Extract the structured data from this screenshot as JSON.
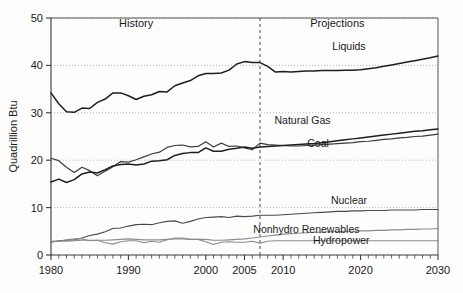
{
  "chart_data": {
    "type": "line",
    "title": "",
    "xlabel": "",
    "ylabel": "Quadrillion Btu",
    "xlim": [
      1980,
      2030
    ],
    "ylim": [
      0,
      50
    ],
    "yticks": [
      0,
      10,
      20,
      30,
      40,
      50
    ],
    "ytick_labels": [
      "0",
      "10",
      "20",
      "30",
      "40",
      "50"
    ],
    "xticks": [
      1980,
      1990,
      2000,
      2005,
      2010,
      2020,
      2030
    ],
    "xtick_labels": [
      "1980",
      "1990",
      "2000",
      "2005",
      "2010",
      "2020",
      "2030"
    ],
    "grid": "horizontal-dotted",
    "legend_position": "inline-right-labels",
    "annotations": [
      {
        "text": "History",
        "x": 1991,
        "y": 48.2,
        "name": "history-annotation"
      },
      {
        "text": "Projections",
        "x": 2017,
        "y": 48.2,
        "name": "projections-annotation"
      }
    ],
    "divider": {
      "x": 2007,
      "style": "dashed",
      "label": "history-projection-divider"
    },
    "series": [
      {
        "name": "Liquids",
        "color": "#1f1f1f",
        "width": 1.5,
        "label_x": 2018.5,
        "label_y": 43.3,
        "x": [
          1980,
          1981,
          1982,
          1983,
          1984,
          1985,
          1986,
          1987,
          1988,
          1989,
          1990,
          1991,
          1992,
          1993,
          1994,
          1995,
          1996,
          1997,
          1998,
          1999,
          2000,
          2001,
          2002,
          2003,
          2004,
          2005,
          2006,
          2007,
          2008,
          2009,
          2010,
          2011,
          2012,
          2013,
          2014,
          2015,
          2016,
          2017,
          2018,
          2019,
          2020,
          2021,
          2022,
          2023,
          2024,
          2025,
          2026,
          2027,
          2028,
          2029,
          2030
        ],
        "y": [
          34.2,
          31.9,
          30.2,
          30.1,
          31.0,
          30.9,
          32.2,
          32.9,
          34.2,
          34.2,
          33.6,
          32.8,
          33.5,
          33.8,
          34.5,
          34.4,
          35.7,
          36.3,
          36.8,
          37.8,
          38.3,
          38.3,
          38.4,
          39.0,
          40.3,
          40.8,
          40.6,
          40.6,
          39.8,
          38.6,
          38.7,
          38.6,
          38.7,
          38.8,
          38.8,
          38.9,
          38.9,
          38.9,
          39.0,
          39.0,
          39.1,
          39.3,
          39.5,
          39.8,
          40.1,
          40.4,
          40.7,
          41.0,
          41.3,
          41.6,
          42.0
        ]
      },
      {
        "name": "Natural Gas",
        "color": "#3c3c3c",
        "width": 1.2,
        "label_x": 2012.5,
        "label_y": 27.6,
        "x": [
          1980,
          1981,
          1982,
          1983,
          1984,
          1985,
          1986,
          1987,
          1988,
          1989,
          1990,
          1991,
          1992,
          1993,
          1994,
          1995,
          1996,
          1997,
          1998,
          1999,
          2000,
          2001,
          2002,
          2003,
          2004,
          2005,
          2006,
          2007,
          2008,
          2009,
          2010,
          2011,
          2012,
          2013,
          2014,
          2015,
          2016,
          2017,
          2018,
          2019,
          2020,
          2021,
          2022,
          2023,
          2024,
          2025,
          2026,
          2027,
          2028,
          2029,
          2030
        ],
        "y": [
          20.4,
          19.9,
          18.5,
          17.4,
          18.5,
          17.8,
          16.7,
          17.7,
          18.6,
          19.7,
          19.6,
          20.1,
          20.7,
          21.3,
          21.7,
          22.7,
          23.1,
          23.2,
          22.8,
          22.9,
          23.9,
          22.8,
          23.6,
          22.9,
          23.0,
          22.6,
          22.2,
          23.6,
          23.3,
          23.2,
          23.1,
          23.0,
          23.0,
          23.1,
          23.2,
          23.3,
          23.4,
          23.5,
          23.6,
          23.7,
          23.9,
          24.0,
          24.2,
          24.4,
          24.5,
          24.7,
          24.8,
          25.0,
          25.1,
          25.3,
          25.5
        ]
      },
      {
        "name": "Coal",
        "color": "#1f1f1f",
        "width": 1.5,
        "label_x": 2014.5,
        "label_y": 22.8,
        "x": [
          1980,
          1981,
          1982,
          1983,
          1984,
          1985,
          1986,
          1987,
          1988,
          1989,
          1990,
          1991,
          1992,
          1993,
          1994,
          1995,
          1996,
          1997,
          1998,
          1999,
          2000,
          2001,
          2002,
          2003,
          2004,
          2005,
          2006,
          2007,
          2008,
          2009,
          2010,
          2011,
          2012,
          2013,
          2014,
          2015,
          2016,
          2017,
          2018,
          2019,
          2020,
          2021,
          2022,
          2023,
          2024,
          2025,
          2026,
          2027,
          2028,
          2029,
          2030
        ],
        "y": [
          15.4,
          16.0,
          15.3,
          15.9,
          17.1,
          17.5,
          17.3,
          18.0,
          18.8,
          19.1,
          19.2,
          19.0,
          19.2,
          19.8,
          19.9,
          20.1,
          21.0,
          21.4,
          21.6,
          21.6,
          22.6,
          21.9,
          21.9,
          22.3,
          22.5,
          22.8,
          22.5,
          22.8,
          22.9,
          23.0,
          23.1,
          23.2,
          23.3,
          23.4,
          23.5,
          23.7,
          23.9,
          24.1,
          24.3,
          24.5,
          24.7,
          24.9,
          25.1,
          25.3,
          25.5,
          25.7,
          25.9,
          26.1,
          26.2,
          26.4,
          26.6
        ]
      },
      {
        "name": "Nuclear",
        "color": "#4a4a4a",
        "width": 1.1,
        "label_x": 2018.5,
        "label_y": 10.7,
        "x": [
          1980,
          1981,
          1982,
          1983,
          1984,
          1985,
          1986,
          1987,
          1988,
          1989,
          1990,
          1991,
          1992,
          1993,
          1994,
          1995,
          1996,
          1997,
          1998,
          1999,
          2000,
          2001,
          2002,
          2003,
          2004,
          2005,
          2006,
          2007,
          2008,
          2009,
          2010,
          2011,
          2012,
          2013,
          2014,
          2015,
          2016,
          2017,
          2018,
          2019,
          2020,
          2021,
          2022,
          2023,
          2024,
          2025,
          2026,
          2027,
          2028,
          2029,
          2030
        ],
        "y": [
          2.7,
          3.0,
          3.1,
          3.2,
          3.6,
          4.1,
          4.4,
          4.9,
          5.6,
          5.7,
          6.1,
          6.4,
          6.5,
          6.4,
          6.8,
          7.1,
          7.2,
          6.7,
          7.1,
          7.6,
          7.9,
          8.0,
          8.1,
          7.9,
          8.2,
          8.1,
          8.2,
          8.4,
          8.4,
          8.4,
          8.5,
          8.6,
          8.7,
          8.8,
          8.9,
          9.0,
          9.1,
          9.2,
          9.2,
          9.3,
          9.3,
          9.4,
          9.4,
          9.4,
          9.5,
          9.5,
          9.5,
          9.5,
          9.6,
          9.6,
          9.6
        ]
      },
      {
        "name": "Nonhydro Renewables",
        "color": "#8c8c8c",
        "width": 1.1,
        "label_x": 2013.0,
        "label_y": 4.6,
        "x": [
          1980,
          1981,
          1982,
          1983,
          1984,
          1985,
          1986,
          1987,
          1988,
          1989,
          1990,
          1991,
          1992,
          1993,
          1994,
          1995,
          1996,
          1997,
          1998,
          1999,
          2000,
          2001,
          2002,
          2003,
          2004,
          2005,
          2006,
          2007,
          2008,
          2009,
          2010,
          2011,
          2012,
          2013,
          2014,
          2015,
          2016,
          2017,
          2018,
          2019,
          2020,
          2021,
          2022,
          2023,
          2024,
          2025,
          2026,
          2027,
          2028,
          2029,
          2030
        ],
        "y": [
          2.9,
          2.9,
          2.9,
          3.0,
          3.1,
          3.1,
          3.1,
          3.1,
          3.2,
          3.3,
          3.4,
          3.3,
          3.2,
          3.2,
          3.2,
          3.3,
          3.4,
          3.4,
          3.3,
          3.3,
          3.3,
          3.1,
          3.1,
          3.2,
          3.3,
          3.4,
          3.6,
          3.8,
          4.0,
          4.2,
          4.4,
          4.5,
          4.6,
          4.7,
          4.8,
          4.8,
          4.9,
          4.9,
          5.0,
          5.0,
          5.1,
          5.1,
          5.2,
          5.2,
          5.3,
          5.3,
          5.4,
          5.4,
          5.5,
          5.5,
          5.6
        ]
      },
      {
        "name": "Hydropower",
        "color": "#8c8c8c",
        "width": 1.1,
        "label_x": 2017.5,
        "label_y": 2.3,
        "x": [
          1980,
          1981,
          1982,
          1983,
          1984,
          1985,
          1986,
          1987,
          1988,
          1989,
          1990,
          1991,
          1992,
          1993,
          1994,
          1995,
          1996,
          1997,
          1998,
          1999,
          2000,
          2001,
          2002,
          2003,
          2004,
          2005,
          2006,
          2007,
          2008,
          2009,
          2010,
          2011,
          2012,
          2013,
          2014,
          2015,
          2016,
          2017,
          2018,
          2019,
          2020,
          2021,
          2022,
          2023,
          2024,
          2025,
          2026,
          2027,
          2028,
          2029,
          2030
        ],
        "y": [
          2.9,
          2.9,
          3.2,
          3.4,
          3.4,
          3.0,
          3.1,
          2.6,
          2.3,
          2.8,
          3.0,
          3.0,
          2.6,
          2.9,
          2.7,
          3.2,
          3.6,
          3.6,
          3.3,
          3.3,
          2.8,
          2.2,
          2.7,
          2.8,
          2.7,
          2.7,
          2.9,
          2.5,
          2.9,
          3.0,
          3.0,
          3.0,
          3.0,
          3.0,
          3.0,
          3.0,
          3.0,
          3.0,
          3.0,
          3.0,
          3.0,
          3.0,
          3.0,
          3.0,
          3.0,
          3.0,
          3.0,
          3.0,
          3.0,
          3.0,
          3.0
        ]
      }
    ]
  }
}
